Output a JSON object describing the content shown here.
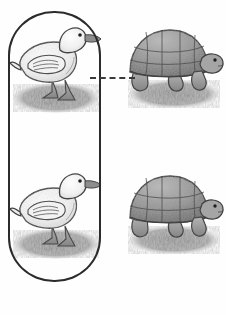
{
  "worksheet": {
    "title": "Animal matching worksheet",
    "description": "Two rows each pairing a duck with a tortoise, joined by a dashed connector line. A rounded rectangle selection box encloses the duck column.",
    "background_color": "#fefefe",
    "width": 226,
    "height": 315
  },
  "selection_box": {
    "name": "selection-box",
    "shape": "rounded-rectangle",
    "stroke_color": "#2b2b2b",
    "stroke_width": 2,
    "encloses": "duck column",
    "label": ""
  },
  "connectors": [
    {
      "name": "connector-1",
      "style": "dashed",
      "color": "#3a3a3a",
      "from": "duck-1",
      "to": "turtle-1"
    },
    {
      "name": "connector-2",
      "style": "dashed",
      "color": "#3a3a3a",
      "from": "duck-2",
      "to": "turtle-2"
    }
  ],
  "pairs": [
    {
      "row": 1,
      "left": {
        "animal": "duck",
        "facing": "right",
        "style": "pencil sketch",
        "ground": "grass patch"
      },
      "right": {
        "animal": "tortoise",
        "facing": "right",
        "style": "pencil sketch",
        "ground": "grass patch"
      }
    },
    {
      "row": 2,
      "left": {
        "animal": "duck",
        "facing": "right",
        "style": "pencil sketch",
        "ground": "grass patch"
      },
      "right": {
        "animal": "tortoise",
        "facing": "right",
        "style": "pencil sketch",
        "ground": "grass patch"
      }
    }
  ],
  "colors": {
    "outline": "#3d3d3d",
    "body_light": "#f6f6f6",
    "body_shade": "#d8d8d8",
    "shell_mid": "#9a9a9a",
    "shell_dark": "#6f6f6f",
    "grass": "#8d8d8d",
    "beak": "#8a8a8a",
    "eye": "#222222"
  }
}
